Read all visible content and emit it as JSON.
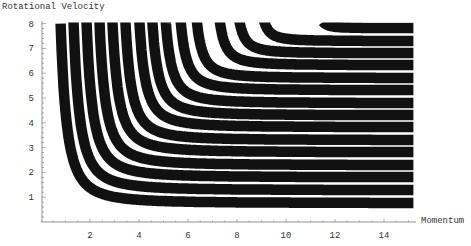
{
  "chart_data": {
    "type": "line",
    "title": "",
    "xlabel": "Momentum",
    "ylabel": "Rotational Velocity",
    "xlim": [
      0,
      15.3
    ],
    "ylim": [
      0,
      8
    ],
    "x_ticks": [
      2,
      4,
      6,
      8,
      10,
      12,
      14
    ],
    "y_ticks": [
      1,
      2,
      3,
      4,
      5,
      6,
      7,
      8
    ],
    "grid": false,
    "legend": null,
    "band_color": "#111111",
    "band_width_px": 10.5,
    "series": [
      {
        "name": "band-1",
        "p_at_top": 0.8,
        "v_at_right": 0.77
      },
      {
        "name": "band-2",
        "p_at_top": 1.33,
        "v_at_right": 1.29
      },
      {
        "name": "band-3",
        "p_at_top": 1.86,
        "v_at_right": 1.81
      },
      {
        "name": "band-4",
        "p_at_top": 2.39,
        "v_at_right": 2.3
      },
      {
        "name": "band-5",
        "p_at_top": 2.92,
        "v_at_right": 2.82
      },
      {
        "name": "band-6",
        "p_at_top": 3.45,
        "v_at_right": 3.31
      },
      {
        "name": "band-7",
        "p_at_top": 4.02,
        "v_at_right": 3.83
      },
      {
        "name": "band-8",
        "p_at_top": 4.55,
        "v_at_right": 4.31
      },
      {
        "name": "band-9",
        "p_at_top": 5.1,
        "v_at_right": 4.8
      },
      {
        "name": "band-10",
        "p_at_top": 5.71,
        "v_at_right": 5.32
      },
      {
        "name": "band-11",
        "p_at_top": 6.37,
        "v_at_right": 5.81
      },
      {
        "name": "band-12",
        "p_at_top": 7.31,
        "v_at_right": 6.33
      },
      {
        "name": "band-13",
        "p_at_top": 8.12,
        "v_at_right": 6.81
      },
      {
        "name": "band-14",
        "p_at_top": 9.14,
        "v_at_right": 7.3
      },
      {
        "name": "band-15",
        "p_at_top": 11.59,
        "v_at_right": 7.82
      }
    ]
  }
}
